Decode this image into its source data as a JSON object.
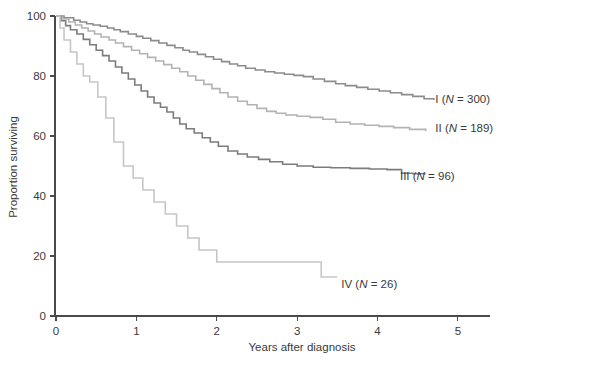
{
  "chart_data": {
    "type": "line",
    "title": "",
    "subtitle": "",
    "xlabel": "Years after diagnosis",
    "ylabel": "Proportion surviving",
    "xlim": [
      0,
      5.4
    ],
    "ylim": [
      0,
      100
    ],
    "xticks": [
      0,
      1,
      2,
      3,
      4,
      5
    ],
    "xtick_labels": [
      "0",
      "1",
      "2",
      "3",
      "4",
      "5"
    ],
    "yticks": [
      0,
      20,
      40,
      60,
      80,
      100
    ],
    "ytick_labels": [
      "0",
      "20",
      "40",
      "60",
      "80",
      "100"
    ],
    "grid": false,
    "legend_position": "inline-right-of-curve-end",
    "step_style": "post",
    "series": [
      {
        "name": "I",
        "label_prefix": "I",
        "label_italic": "N",
        "label_suffix": " = 300)",
        "n": 300,
        "color": "#8c8c8c",
        "label_x": 4.72,
        "label_y": 71.0,
        "x": [
          0.0,
          0.1,
          0.22,
          0.3,
          0.38,
          0.46,
          0.55,
          0.64,
          0.72,
          0.8,
          0.9,
          1.0,
          1.08,
          1.18,
          1.28,
          1.38,
          1.48,
          1.58,
          1.66,
          1.76,
          1.86,
          1.96,
          2.06,
          2.16,
          2.26,
          2.36,
          2.48,
          2.6,
          2.72,
          2.84,
          2.96,
          3.08,
          3.2,
          3.34,
          3.48,
          3.6,
          3.74,
          3.88,
          4.02,
          4.16,
          4.3,
          4.44,
          4.58,
          4.7
        ],
        "y": [
          100.0,
          99.4,
          98.6,
          98.0,
          97.4,
          97.0,
          96.6,
          96.0,
          95.4,
          94.8,
          94.0,
          93.2,
          92.6,
          91.8,
          91.0,
          90.2,
          89.4,
          88.6,
          88.0,
          87.2,
          86.4,
          85.6,
          84.8,
          84.0,
          83.4,
          82.6,
          82.0,
          81.4,
          81.0,
          80.6,
          80.2,
          79.8,
          79.0,
          78.2,
          77.4,
          76.8,
          76.2,
          75.6,
          75.0,
          74.4,
          73.8,
          73.2,
          72.4,
          72.0
        ]
      },
      {
        "name": "II",
        "label_prefix": "II",
        "label_italic": "N",
        "label_suffix": " = 189)",
        "n": 189,
        "color": "#b3b3b3",
        "label_x": 4.72,
        "label_y": 61.5,
        "x": [
          0.0,
          0.08,
          0.16,
          0.24,
          0.32,
          0.4,
          0.48,
          0.56,
          0.66,
          0.74,
          0.84,
          0.94,
          1.04,
          1.14,
          1.24,
          1.34,
          1.44,
          1.54,
          1.64,
          1.74,
          1.84,
          1.94,
          2.04,
          2.14,
          2.26,
          2.38,
          2.5,
          2.62,
          2.74,
          2.86,
          3.0,
          3.16,
          3.32,
          3.48,
          3.66,
          3.84,
          4.02,
          4.2,
          4.4,
          4.6
        ],
        "y": [
          100.0,
          99.0,
          98.0,
          97.0,
          96.0,
          95.0,
          94.0,
          93.0,
          92.0,
          91.0,
          89.8,
          88.6,
          87.4,
          86.2,
          85.0,
          83.8,
          82.6,
          81.4,
          80.0,
          78.6,
          77.2,
          75.8,
          74.4,
          73.0,
          71.6,
          70.4,
          69.2,
          68.2,
          67.6,
          67.0,
          66.6,
          66.2,
          65.6,
          64.6,
          64.0,
          63.6,
          63.2,
          62.8,
          62.2,
          61.6
        ]
      },
      {
        "name": "III",
        "label_prefix": "III",
        "label_italic": "N",
        "label_suffix": " = 96)",
        "n": 96,
        "color": "#7c7c7c",
        "label_x": 4.28,
        "label_y": 45.5,
        "x": [
          0.0,
          0.06,
          0.12,
          0.18,
          0.26,
          0.34,
          0.42,
          0.5,
          0.58,
          0.66,
          0.74,
          0.82,
          0.9,
          0.98,
          1.06,
          1.14,
          1.22,
          1.3,
          1.38,
          1.46,
          1.54,
          1.62,
          1.72,
          1.82,
          1.92,
          2.02,
          2.14,
          2.26,
          2.38,
          2.52,
          2.66,
          2.82,
          3.0,
          3.2,
          3.42,
          3.66,
          3.9,
          4.12,
          4.3,
          4.44,
          4.6
        ],
        "y": [
          100.0,
          98.4,
          96.8,
          95.4,
          94.0,
          92.2,
          90.4,
          88.6,
          86.8,
          85.0,
          83.0,
          81.0,
          79.0,
          77.0,
          75.0,
          73.0,
          71.0,
          69.6,
          68.0,
          66.0,
          64.0,
          62.4,
          61.0,
          59.4,
          58.0,
          56.6,
          55.0,
          54.0,
          53.0,
          52.2,
          51.4,
          50.6,
          50.0,
          49.6,
          49.4,
          49.2,
          49.0,
          48.8,
          47.6,
          47.4,
          47.4
        ]
      },
      {
        "name": "IV",
        "label_prefix": "IV",
        "label_italic": "N",
        "label_suffix": " = 26)",
        "n": 26,
        "color": "#c6c6c6",
        "label_x": 3.55,
        "label_y": 9.5,
        "x": [
          0.0,
          0.05,
          0.1,
          0.18,
          0.26,
          0.34,
          0.42,
          0.52,
          0.62,
          0.72,
          0.84,
          0.96,
          1.08,
          1.22,
          1.36,
          1.5,
          1.64,
          1.78,
          2.0,
          2.4,
          2.8,
          3.1,
          3.3,
          3.5
        ],
        "y": [
          100.0,
          96.0,
          92.0,
          88.0,
          84.0,
          80.0,
          78.0,
          73.0,
          66.0,
          58.0,
          50.0,
          46.0,
          42.0,
          38.0,
          34.0,
          30.0,
          26.0,
          22.0,
          18.0,
          18.0,
          18.0,
          18.0,
          13.0,
          13.0
        ]
      }
    ]
  },
  "axes": {
    "y_axis_title": "Proportion surviving",
    "x_axis_title": "Years after diagnosis"
  }
}
